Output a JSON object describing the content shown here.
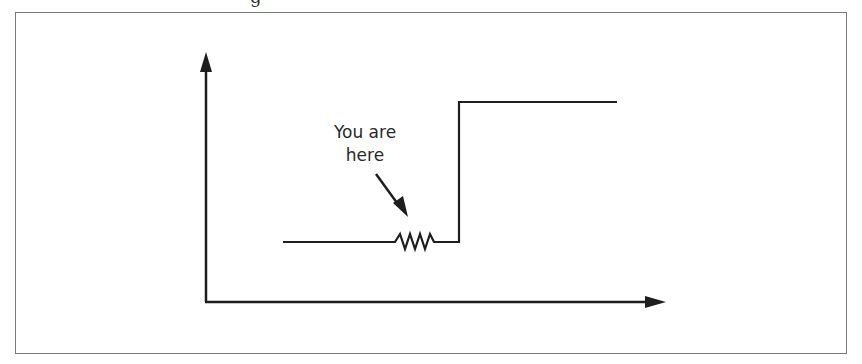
{
  "figure": {
    "title_fragment": "g",
    "annotation": {
      "line1": "You are",
      "line2": "here"
    },
    "colors": {
      "stroke": "#1e1e1e",
      "frame": "#7a7a7a",
      "background": "#ffffff"
    }
  }
}
